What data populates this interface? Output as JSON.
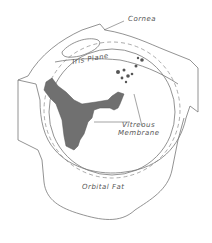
{
  "figure": {
    "labels": {
      "cornea": "Cornea",
      "iris_plane": "Iris Plane",
      "vitreous_line1": "Vitreous",
      "vitreous_line2": "Membrane",
      "orbital_fat": "Orbital Fat"
    },
    "colors": {
      "line": "#666666",
      "fill": "#6e6e6e",
      "background": "#ffffff"
    }
  }
}
